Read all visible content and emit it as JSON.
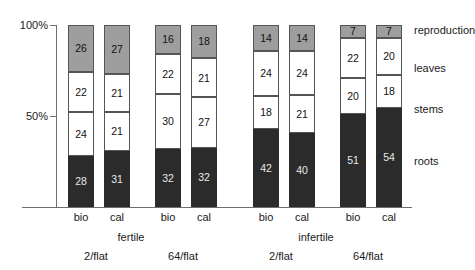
{
  "chart_data": {
    "type": "bar",
    "stacked": true,
    "title": "",
    "xlabel": "",
    "ylabel": "",
    "ylim": [
      0,
      100
    ],
    "grid": false,
    "legend_position": "right",
    "y_ticks": [
      "50%",
      "100%"
    ],
    "y_tick_values": [
      50,
      100
    ],
    "categories": [
      "bio",
      "cal",
      "bio",
      "cal",
      "bio",
      "cal",
      "bio",
      "cal"
    ],
    "group_labels": [
      "fertile",
      "infertile"
    ],
    "sub_labels": [
      "2/flat",
      "64/flat",
      "2/flat",
      "64/flat"
    ],
    "series": [
      {
        "name": "roots",
        "color": "#2b2b2b",
        "values": [
          28,
          31,
          32,
          32,
          42,
          40,
          51,
          54
        ]
      },
      {
        "name": "stems",
        "color": "#ffffff",
        "values": [
          24,
          21,
          30,
          27,
          18,
          21,
          20,
          18
        ]
      },
      {
        "name": "leaves",
        "color": "#ffffff",
        "values": [
          22,
          21,
          22,
          21,
          24,
          24,
          22,
          20
        ]
      },
      {
        "name": "reproduction",
        "color": "#9e9e9e",
        "values": [
          26,
          27,
          16,
          18,
          14,
          14,
          7,
          7
        ]
      }
    ],
    "legend_entries": [
      "reproduction",
      "leaves",
      "stems",
      "roots"
    ]
  },
  "axis": {
    "y_tick_100": "100%",
    "y_tick_50": "50%"
  },
  "ticks": {
    "t0": "bio",
    "t1": "cal",
    "t2": "bio",
    "t3": "cal",
    "t4": "bio",
    "t5": "cal",
    "t6": "bio",
    "t7": "cal"
  },
  "groups": {
    "g0": "fertile",
    "g1": "infertile"
  },
  "subs": {
    "s0": "2/flat",
    "s1": "64/flat",
    "s2": "2/flat",
    "s3": "64/flat"
  },
  "legend": {
    "l0": "reproduction",
    "l1": "leaves",
    "l2": "stems",
    "l3": "roots"
  },
  "values": {
    "b0": {
      "reproduction": "26",
      "leaves": "22",
      "stems": "24",
      "roots": "28"
    },
    "b1": {
      "reproduction": "27",
      "leaves": "21",
      "stems": "21",
      "roots": "31"
    },
    "b2": {
      "reproduction": "16",
      "leaves": "22",
      "stems": "30",
      "roots": "32"
    },
    "b3": {
      "reproduction": "18",
      "leaves": "21",
      "stems": "27",
      "roots": "32"
    },
    "b4": {
      "reproduction": "14",
      "leaves": "24",
      "stems": "18",
      "roots": "42"
    },
    "b5": {
      "reproduction": "14",
      "leaves": "24",
      "stems": "21",
      "roots": "40"
    },
    "b6": {
      "reproduction": "7",
      "leaves": "22",
      "stems": "20",
      "roots": "51"
    },
    "b7": {
      "reproduction": "7",
      "leaves": "20",
      "stems": "18",
      "roots": "54"
    }
  }
}
